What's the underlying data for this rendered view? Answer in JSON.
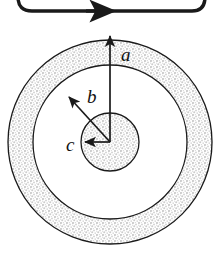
{
  "figure": {
    "type": "technical-diagram",
    "background_color": "#ffffff",
    "line_color": "#1a1a1a",
    "shade_color": "#d8d8d8",
    "text_color": "#111111"
  },
  "current_loop": {
    "name": "current-loop",
    "description": "Partially visible rounded rectangle wire loop at top, cropped by image edge",
    "arrow_direction": "right",
    "stroke_width_px": 3,
    "left_x": 18,
    "right_x": 205,
    "bottom_y": 11,
    "corner_radius": 14,
    "arrowhead_x": 96
  },
  "circles": {
    "center": {
      "x": 110,
      "y": 142
    },
    "items": [
      {
        "name": "outer-circle",
        "radius": 102,
        "fill": "shaded",
        "label": "a"
      },
      {
        "name": "middle-circle",
        "radius": 77,
        "fill": "white",
        "label": "b"
      },
      {
        "name": "inner-circle",
        "radius": 29,
        "fill": "shaded",
        "label": "c"
      }
    ]
  },
  "radius_arrows": [
    {
      "name": "radius-arrow-a",
      "label": "a",
      "from": {
        "x": 110,
        "y": 142
      },
      "to": {
        "x": 110,
        "y": 34
      },
      "angle_deg": 90,
      "length_px": 108,
      "label_position": {
        "x": 121,
        "y": 45
      }
    },
    {
      "name": "radius-arrow-b",
      "label": "b",
      "from": {
        "x": 110,
        "y": 142
      },
      "to": {
        "x": 68,
        "y": 96
      },
      "angle_deg": 135,
      "length_px": 62,
      "label_position": {
        "x": 87,
        "y": 87
      }
    },
    {
      "name": "radius-arrow-c",
      "label": "c",
      "from": {
        "x": 110,
        "y": 142
      },
      "to": {
        "x": 83,
        "y": 142
      },
      "angle_deg": 180,
      "length_px": 27,
      "label_position": {
        "x": 66,
        "y": 135
      }
    }
  ],
  "labels": {
    "a": "a",
    "b": "b",
    "c": "c"
  }
}
